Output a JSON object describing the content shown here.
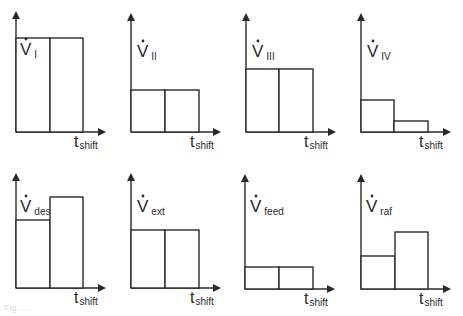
{
  "diagram": {
    "x_axis_label": {
      "main": "t",
      "sub": "shift"
    },
    "y_symbol": "V",
    "stroke_color": "#2a2a2a",
    "background": "#ffffff",
    "panels": [
      {
        "id": "V_I",
        "label_sub": "I",
        "ox": 16,
        "oy": 132,
        "ytop": 13,
        "xend": 104,
        "div": 50,
        "right": 83,
        "tops": [
          38,
          38
        ],
        "label_x": 20,
        "label_y": 55
      },
      {
        "id": "V_II",
        "label_sub": "II",
        "ox": 131,
        "oy": 132,
        "ytop": 15,
        "xend": 219,
        "div": 165,
        "right": 199,
        "tops": [
          90,
          90
        ],
        "label_x": 137,
        "label_y": 57
      },
      {
        "id": "V_III",
        "label_sub": "III",
        "ox": 246,
        "oy": 132,
        "ytop": 15,
        "xend": 334,
        "div": 279,
        "right": 313,
        "tops": [
          69,
          69
        ],
        "label_x": 252,
        "label_y": 57
      },
      {
        "id": "V_IV",
        "label_sub": "IV",
        "ox": 361,
        "oy": 132,
        "ytop": 15,
        "xend": 449,
        "div": 394,
        "right": 428,
        "tops": [
          100,
          121
        ],
        "label_x": 367,
        "label_y": 57
      },
      {
        "id": "V_des",
        "label_sub": "des",
        "ox": 16,
        "oy": 288,
        "ytop": 175,
        "xend": 104,
        "div": 50,
        "right": 83,
        "tops": [
          220,
          197
        ],
        "label_x": 20,
        "label_y": 212
      },
      {
        "id": "V_ext",
        "label_sub": "ext",
        "ox": 131,
        "oy": 288,
        "ytop": 175,
        "xend": 219,
        "div": 165,
        "right": 199,
        "tops": [
          230,
          230
        ],
        "label_x": 137,
        "label_y": 212
      },
      {
        "id": "V_feed",
        "label_sub": "feed",
        "ox": 245,
        "oy": 289,
        "ytop": 176,
        "xend": 333,
        "div": 279,
        "right": 313,
        "tops": [
          267,
          267
        ],
        "label_x": 250,
        "label_y": 212
      },
      {
        "id": "V_raf",
        "label_sub": "raf",
        "ox": 361,
        "oy": 289,
        "ytop": 176,
        "xend": 449,
        "div": 395,
        "right": 428,
        "tops": [
          256,
          232
        ],
        "label_x": 366,
        "label_y": 212
      }
    ],
    "relative_levels": {
      "V_I": [
        1.0,
        1.0
      ],
      "V_II": [
        0.45,
        0.45
      ],
      "V_III": [
        0.67,
        0.67
      ],
      "V_IV": [
        0.34,
        0.12
      ],
      "V_des": [
        0.72,
        0.97
      ],
      "V_ext": [
        0.62,
        0.62
      ],
      "V_feed": [
        0.22,
        0.22
      ],
      "V_raf": [
        0.34,
        0.6
      ]
    }
  },
  "caption": "Fig. ..."
}
